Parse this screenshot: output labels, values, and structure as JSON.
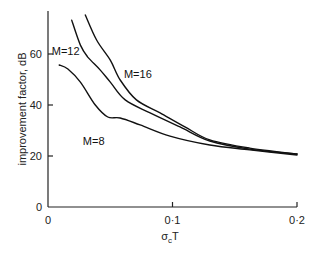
{
  "chart_data": {
    "type": "line",
    "title": "",
    "xlabel": "σcT",
    "xlabel_main": "σ",
    "xlabel_sub": "c",
    "xlabel_tail": "T",
    "ylabel": "improvement factor, dB",
    "xlim": [
      0,
      0.2
    ],
    "ylim": [
      0,
      75
    ],
    "grid": false,
    "legend": "inline labels",
    "x_ticks": [
      {
        "value": 0,
        "label": "0"
      },
      {
        "value": 0.1,
        "label": "0·1"
      },
      {
        "value": 0.2,
        "label": "0·2"
      }
    ],
    "y_ticks": [
      {
        "value": 0,
        "label": "0"
      },
      {
        "value": 20,
        "label": "20"
      },
      {
        "value": 40,
        "label": "40"
      },
      {
        "value": 60,
        "label": "60"
      }
    ],
    "series": [
      {
        "name": "M=16",
        "label": "M=16",
        "label_pos": [
          0.061,
          52
        ],
        "x": [
          0.03,
          0.039,
          0.05,
          0.058,
          0.071,
          0.09,
          0.11,
          0.13,
          0.162,
          0.2
        ],
        "values": [
          75.3,
          65.5,
          57.6,
          49.8,
          42.0,
          36.9,
          31.4,
          26.3,
          23.1,
          20.8
        ]
      },
      {
        "name": "M=12",
        "label": "M=12",
        "label_pos": [
          0.003,
          61
        ],
        "x": [
          0.019,
          0.026,
          0.032,
          0.042,
          0.05,
          0.062,
          0.082,
          0.106,
          0.13,
          0.162,
          0.2
        ],
        "values": [
          73.3,
          63.5,
          58.8,
          53.7,
          49.0,
          42.0,
          36.9,
          31.4,
          25.9,
          22.7,
          20.8
        ]
      },
      {
        "name": "M=8",
        "label": "M=8",
        "label_pos": [
          0.028,
          26
        ],
        "x": [
          0.009,
          0.016,
          0.026,
          0.038,
          0.048,
          0.058,
          0.074,
          0.098,
          0.13,
          0.162,
          0.2
        ],
        "values": [
          55.7,
          54.1,
          49.0,
          40.0,
          35.3,
          34.9,
          32.2,
          27.8,
          24.3,
          22.4,
          20.4
        ]
      }
    ]
  }
}
